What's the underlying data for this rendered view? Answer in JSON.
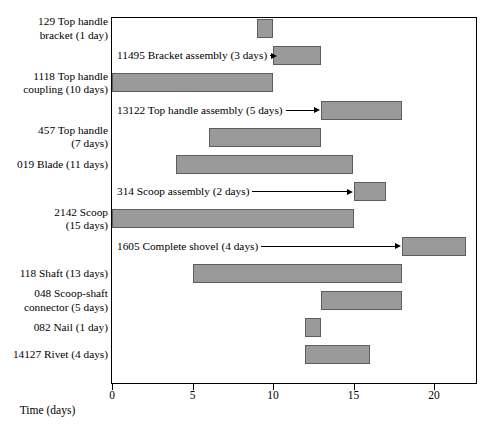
{
  "chart_data": {
    "type": "bar",
    "title": "",
    "xlabel": "Time (days)",
    "ylabel": "",
    "xlim": [
      0,
      22.9
    ],
    "grid": false,
    "legend": null,
    "orientation": "horizontal-gantt",
    "bar_color": "#9a9a9a",
    "bar_edge_color": "#5d5d5d",
    "xticks": [
      {
        "value": 0,
        "label": "0"
      },
      {
        "value": 5,
        "label": "5"
      },
      {
        "value": 10,
        "label": "10"
      },
      {
        "value": 15,
        "label": "15"
      },
      {
        "value": 20,
        "label": "20"
      }
    ],
    "tasks": [
      {
        "label": "129 Top handle\nbracket (1 day)",
        "id": "129",
        "name": "Top handle bracket",
        "duration": 1,
        "start": 9,
        "end": 10,
        "label_position": "left-axis",
        "annotation": null
      },
      {
        "label": "",
        "id": "11495",
        "name": "Bracket assembly",
        "duration": 3,
        "start": 10,
        "end": 13,
        "label_position": "in-plot",
        "annotation": "11495 Bracket assembly (3 days)"
      },
      {
        "label": "1118 Top handle\ncoupling (10 days)",
        "id": "1118",
        "name": "Top handle coupling",
        "duration": 10,
        "start": 0,
        "end": 10,
        "label_position": "left-axis",
        "annotation": null
      },
      {
        "label": "",
        "id": "13122",
        "name": "Top handle assembly",
        "duration": 5,
        "start": 13,
        "end": 18,
        "label_position": "in-plot",
        "annotation": "13122 Top handle assembly (5 days)"
      },
      {
        "label": "457 Top handle\n(7 days)",
        "id": "457",
        "name": "Top handle",
        "duration": 7,
        "start": 6,
        "end": 13,
        "label_position": "left-axis",
        "annotation": null
      },
      {
        "label": "019 Blade (11 days)",
        "id": "019",
        "name": "Blade",
        "duration": 11,
        "start": 4,
        "end": 15,
        "label_position": "left-axis",
        "annotation": null
      },
      {
        "label": "",
        "id": "314",
        "name": "Scoop assembly",
        "duration": 2,
        "start": 15,
        "end": 17,
        "label_position": "in-plot",
        "annotation": "314 Scoop assembly (2 days)"
      },
      {
        "label": "2142 Scoop\n(15 days)",
        "id": "2142",
        "name": "Scoop",
        "duration": 15,
        "start": 0,
        "end": 15,
        "label_position": "left-axis",
        "annotation": null
      },
      {
        "label": "",
        "id": "1605",
        "name": "Complete shovel",
        "duration": 4,
        "start": 18,
        "end": 22,
        "label_position": "in-plot",
        "annotation": "1605 Complete shovel (4 days)"
      },
      {
        "label": "118 Shaft (13 days)",
        "id": "118",
        "name": "Shaft",
        "duration": 13,
        "start": 5,
        "end": 18,
        "label_position": "left-axis",
        "annotation": null
      },
      {
        "label": "048 Scoop-shaft\nconnector (5 days)",
        "id": "048",
        "name": "Scoop-shaft connector",
        "duration": 5,
        "start": 13,
        "end": 18,
        "label_position": "left-axis",
        "annotation": null
      },
      {
        "label": "082 Nail (1 day)",
        "id": "082",
        "name": "Nail",
        "duration": 1,
        "start": 12,
        "end": 13,
        "label_position": "left-axis",
        "annotation": null
      },
      {
        "label": "14127 Rivet (4 days)",
        "id": "14127",
        "name": "Rivet",
        "duration": 4,
        "start": 12,
        "end": 16,
        "label_position": "left-axis",
        "annotation": null
      }
    ]
  }
}
